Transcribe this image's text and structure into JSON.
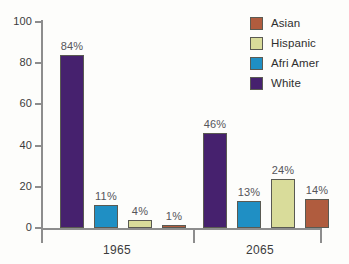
{
  "chart_data": {
    "type": "bar",
    "title": "",
    "subtitle": "",
    "xlabel": "",
    "ylabel": "",
    "ylim": [
      0,
      100
    ],
    "yticks": [
      "0",
      "20",
      "40",
      "60",
      "80",
      "100"
    ],
    "grid": false,
    "legend_position": "top-right",
    "categories": [
      "1965",
      "2065"
    ],
    "series": [
      {
        "name": "White",
        "color": "#46216e",
        "values": [
          84,
          46
        ],
        "labels": [
          "84%",
          "46%"
        ]
      },
      {
        "name": "Afri Amer",
        "color": "#1f8fc4",
        "values": [
          11,
          13
        ],
        "labels": [
          "11%",
          "13%"
        ]
      },
      {
        "name": "Hispanic",
        "color": "#d9dc9a",
        "values": [
          4,
          24
        ],
        "labels": [
          "4%",
          "24%"
        ]
      },
      {
        "name": "Asian",
        "color": "#b05c3e",
        "values": [
          1,
          14
        ],
        "labels": [
          "1%",
          "14%"
        ]
      }
    ]
  },
  "axis": {
    "y_ticks": [
      {
        "label": "100",
        "value": 100
      },
      {
        "label": "80",
        "value": 80
      },
      {
        "label": "60",
        "value": 60
      },
      {
        "label": "40",
        "value": 40
      },
      {
        "label": "20",
        "value": 20
      },
      {
        "label": "0",
        "value": 0
      }
    ],
    "x_labels": [
      "1965",
      "2065"
    ]
  },
  "legend": {
    "items": [
      {
        "label": "Asian",
        "color": "#b05c3e"
      },
      {
        "label": "Hispanic",
        "color": "#d9dc9a"
      },
      {
        "label": "Afri Amer",
        "color": "#1f8fc4"
      },
      {
        "label": "White",
        "color": "#46216e"
      }
    ]
  },
  "bars": [
    {
      "group": "1965",
      "series": "White",
      "label": "84%",
      "value": 84
    },
    {
      "group": "1965",
      "series": "Afri Amer",
      "label": "11%",
      "value": 11
    },
    {
      "group": "1965",
      "series": "Hispanic",
      "label": "4%",
      "value": 4
    },
    {
      "group": "1965",
      "series": "Asian",
      "label": "1%",
      "value": 1
    },
    {
      "group": "2065",
      "series": "White",
      "label": "46%",
      "value": 46
    },
    {
      "group": "2065",
      "series": "Afri Amer",
      "label": "13%",
      "value": 13
    },
    {
      "group": "2065",
      "series": "Hispanic",
      "label": "24%",
      "value": 24
    },
    {
      "group": "2065",
      "series": "Asian",
      "label": "14%",
      "value": 14
    }
  ]
}
